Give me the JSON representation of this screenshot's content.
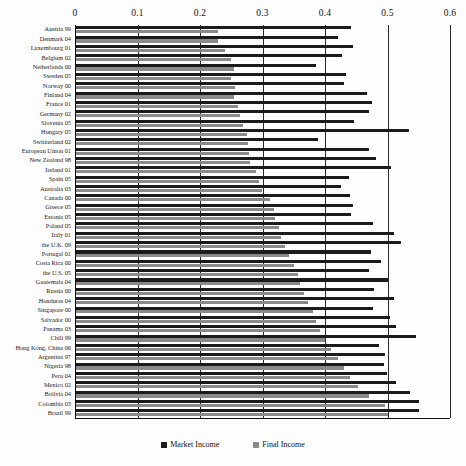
{
  "chart_data": {
    "type": "bar",
    "orientation": "horizontal",
    "title": "",
    "xlabel": "",
    "ylabel": "",
    "xlim": [
      0,
      0.6
    ],
    "xticks": [
      0,
      0.1,
      0.2,
      0.3,
      0.4,
      0.5,
      0.6
    ],
    "xtick_labels": [
      "0",
      "0.1",
      "0.2",
      "0.3",
      "0.4",
      "0.5",
      "0.6"
    ],
    "grid": true,
    "legend_position": "bottom",
    "legend": [
      "Market Income",
      "Final Income"
    ],
    "colors": {
      "market_income": "#1b1b1b",
      "final_income": "#8a8a8a",
      "axis": "#111111",
      "background": "#ffffff"
    },
    "categories": [
      "Austria 99",
      "Denmark 04",
      "Luxembourg 01",
      "Belgium 02",
      "Netherlands 00",
      "Sweden 05",
      "Norway 00",
      "Finland 04",
      "France 01",
      "Germany 02",
      "Slovenia 05",
      "Hungary 05",
      "Switzerland 02",
      "European Union 01",
      "New Zealand 98",
      "Ireland 01",
      "Spain 05",
      "Australia 03",
      "Canada 00",
      "Greece 05",
      "Estonia 05",
      "Poland 05",
      "Italy 01",
      "the U.K. 09",
      "Portugal 01",
      "Costa Rica 00",
      "the U.S. 05",
      "Guatemala 04",
      "Russia 00",
      "Honduras 04",
      "Singapore 00",
      "Salvador 00",
      "Panama 03",
      "Chili 99",
      "Hong Kong, China 06",
      "Argentina 97",
      "Nigeria 98",
      "Peru 04",
      "Mexico 02",
      "Bolivia 04",
      "Colombia 03",
      "Brazil 99"
    ],
    "series": [
      {
        "name": "Market Income",
        "color": "#1b1b1b",
        "values": [
          0.441,
          0.42,
          0.445,
          0.427,
          0.386,
          0.433,
          0.43,
          0.467,
          0.475,
          0.471,
          0.447,
          0.535,
          0.388,
          0.47,
          0.481,
          0.506,
          0.439,
          0.425,
          0.44,
          0.444,
          0.441,
          0.476,
          0.51,
          0.521,
          0.474,
          0.489,
          0.47,
          0.501,
          0.478,
          0.51,
          0.477,
          0.504,
          0.513,
          0.545,
          0.486,
          0.496,
          0.494,
          0.499,
          0.514,
          0.536,
          0.55,
          0.551
        ]
      },
      {
        "name": "Final Income",
        "color": "#8a8a8a",
        "values": [
          0.228,
          0.229,
          0.24,
          0.25,
          0.254,
          0.25,
          0.256,
          0.254,
          0.26,
          0.264,
          0.268,
          0.275,
          0.276,
          0.278,
          0.28,
          0.289,
          0.295,
          0.299,
          0.312,
          0.318,
          0.32,
          0.326,
          0.33,
          0.336,
          0.342,
          0.35,
          0.356,
          0.36,
          0.367,
          0.372,
          0.38,
          0.386,
          0.392,
          0.4,
          0.41,
          0.421,
          0.43,
          0.44,
          0.452,
          0.47,
          0.496,
          0.5
        ]
      }
    ]
  }
}
